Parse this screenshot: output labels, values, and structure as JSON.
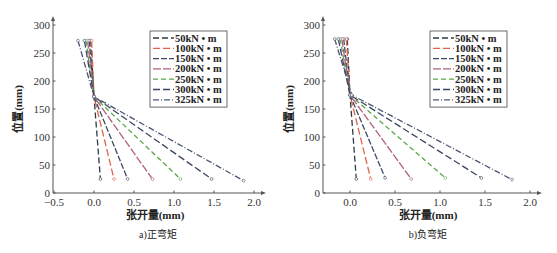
{
  "chart_data": [
    {
      "type": "line",
      "caption": "a)正弯矩",
      "xlabel": "张开量(mm)",
      "ylabel": "位置(mm)",
      "xlim": [
        -0.5,
        2.0
      ],
      "ylim": [
        0,
        300
      ],
      "xticks": [
        "-0.5",
        "0.0",
        "0.5",
        "1.0",
        "1.5",
        "2.0"
      ],
      "yticks": [
        "0",
        "50",
        "100",
        "150",
        "200",
        "250",
        "300"
      ],
      "grid": false,
      "legend_position": "upper right",
      "series": [
        {
          "name": "50kN · m",
          "color": "#2f3a45",
          "points": [
            [
              -0.04,
              272
            ],
            [
              0.0,
              172
            ],
            [
              0.08,
              25
            ]
          ]
        },
        {
          "name": "100kN · m",
          "color": "#e0634a",
          "points": [
            [
              -0.03,
              272
            ],
            [
              0.0,
              172
            ],
            [
              0.25,
              25
            ]
          ]
        },
        {
          "name": "150kN · m",
          "color": "#3a4a66",
          "points": [
            [
              -0.06,
              272
            ],
            [
              0.0,
              172
            ],
            [
              0.42,
              25
            ]
          ]
        },
        {
          "name": "200kN · m",
          "color": "#b0607a",
          "points": [
            [
              -0.08,
              272
            ],
            [
              0.0,
              172
            ],
            [
              0.73,
              25
            ]
          ]
        },
        {
          "name": "250kN · m",
          "color": "#5aa84a",
          "points": [
            [
              -0.1,
              272
            ],
            [
              0.0,
              172
            ],
            [
              1.08,
              25
            ]
          ]
        },
        {
          "name": "300kN · m",
          "color": "#3d4660",
          "points": [
            [
              -0.12,
              272
            ],
            [
              0.0,
              172
            ],
            [
              1.47,
              25
            ]
          ]
        },
        {
          "name": "325kN · m",
          "color": "#4c5572",
          "points": [
            [
              -0.2,
              272
            ],
            [
              0.0,
              172
            ],
            [
              1.87,
              22
            ]
          ]
        }
      ]
    },
    {
      "type": "line",
      "caption": "b)负弯矩",
      "xlabel": "张开量(mm)",
      "ylabel": "位置(mm)",
      "xlim": [
        -0.3,
        2.0
      ],
      "ylim": [
        0,
        300
      ],
      "xticks": [
        "0.0",
        "0.5",
        "1.0",
        "1.5",
        "2.0"
      ],
      "yticks": [
        "0",
        "50",
        "100",
        "150",
        "200",
        "250",
        "300"
      ],
      "grid": false,
      "legend_position": "upper right",
      "series": [
        {
          "name": "50kN · m",
          "color": "#2f3a45",
          "points": [
            [
              -0.03,
              275
            ],
            [
              0.0,
              175
            ],
            [
              0.07,
              25
            ]
          ]
        },
        {
          "name": "100kN · m",
          "color": "#e0634a",
          "points": [
            [
              -0.04,
              275
            ],
            [
              0.0,
              175
            ],
            [
              0.23,
              25
            ]
          ]
        },
        {
          "name": "150kN · m",
          "color": "#3a4a66",
          "points": [
            [
              -0.07,
              275
            ],
            [
              0.0,
              175
            ],
            [
              0.39,
              27
            ]
          ]
        },
        {
          "name": "200kN · m",
          "color": "#b0607a",
          "points": [
            [
              -0.09,
              275
            ],
            [
              0.0,
              175
            ],
            [
              0.68,
              25
            ]
          ]
        },
        {
          "name": "250kN · m",
          "color": "#5aa84a",
          "points": [
            [
              -0.11,
              275
            ],
            [
              0.0,
              175
            ],
            [
              1.06,
              27
            ]
          ]
        },
        {
          "name": "300kN · m",
          "color": "#3d4660",
          "points": [
            [
              -0.13,
              275
            ],
            [
              0.0,
              175
            ],
            [
              1.46,
              27
            ]
          ]
        },
        {
          "name": "325kN · m",
          "color": "#4c5572",
          "points": [
            [
              -0.17,
              275
            ],
            [
              0.02,
              175
            ],
            [
              1.8,
              24
            ]
          ]
        }
      ]
    }
  ]
}
